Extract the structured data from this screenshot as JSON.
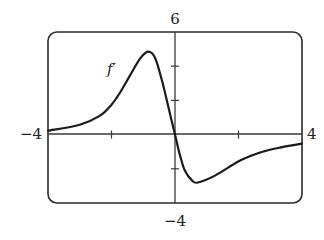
{
  "chart_data": {
    "type": "line",
    "title": "",
    "xlabel": "",
    "ylabel": "",
    "xlim": [
      -4,
      4
    ],
    "ylim": [
      -4,
      6
    ],
    "grid": false,
    "legend": "none",
    "x_tick_values": [
      -2,
      2
    ],
    "y_tick_values": [
      -2,
      2,
      4
    ],
    "axis_labels": {
      "x_min": "−4",
      "x_max": "4",
      "y_max": "6",
      "y_min": "−4"
    },
    "annotations": [
      {
        "text": "f′",
        "x": -1.9,
        "y": 3.6
      }
    ],
    "series": [
      {
        "name": "f′",
        "color": "#1a1a1a",
        "x": [
          -4,
          -3,
          -2.36,
          -2,
          -1.73,
          -1.42,
          -1.1,
          -0.85,
          -0.63,
          -0.41,
          -0.22,
          0,
          0.16,
          0.31,
          0.54,
          0.72,
          1.26,
          2.05,
          2.68,
          3.31,
          4
        ],
        "y": [
          0.23,
          0.58,
          1.11,
          1.75,
          2.46,
          3.45,
          4.44,
          4.85,
          4.5,
          3.16,
          1.7,
          0,
          -1.23,
          -2.1,
          -2.69,
          -2.8,
          -2.4,
          -1.52,
          -1.05,
          -0.76,
          -0.53
        ]
      }
    ]
  },
  "labels": {
    "x_min": "−4",
    "x_max": "4",
    "y_max": "6",
    "y_min": "−4",
    "curve": "f′"
  },
  "colors": {
    "frame": "#2a2a2a",
    "axis": "#3a3a3a",
    "curve": "#1a1a1a"
  }
}
